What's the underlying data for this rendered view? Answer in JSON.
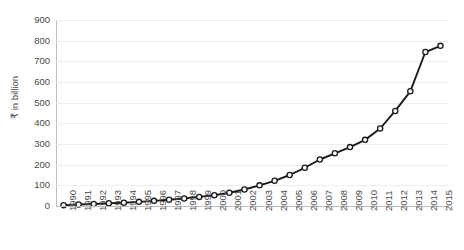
{
  "chart_data": {
    "type": "line",
    "title": "",
    "subtitle": "",
    "xlabel": "",
    "ylabel": "₹ in billion",
    "categories": [
      "1990",
      "1991",
      "1992",
      "1993",
      "1994",
      "1995",
      "1996",
      "1997",
      "1998",
      "1999",
      "2000",
      "2001",
      "2002",
      "2003",
      "2004",
      "2005",
      "2006",
      "2007",
      "2008",
      "2009",
      "2010",
      "2011",
      "2012",
      "2013",
      "2014",
      "2015"
    ],
    "values": [
      4,
      7,
      10,
      13,
      16,
      20,
      25,
      30,
      36,
      44,
      52,
      64,
      80,
      100,
      122,
      150,
      185,
      225,
      255,
      285,
      320,
      375,
      460,
      555,
      745,
      775
    ],
    "series": [
      {
        "name": "Value",
        "values": [
          4,
          7,
          10,
          13,
          16,
          20,
          25,
          30,
          36,
          44,
          52,
          64,
          80,
          100,
          122,
          150,
          185,
          225,
          255,
          285,
          320,
          375,
          460,
          555,
          745,
          775
        ]
      }
    ],
    "ylim": [
      0,
      900
    ],
    "yticks": [
      0,
      100,
      200,
      300,
      400,
      500,
      600,
      700,
      800,
      900
    ],
    "ytick_labels": [
      "0",
      "100",
      "200",
      "300",
      "400",
      "500",
      "600",
      "700",
      "800",
      "900"
    ],
    "grid": true,
    "grid_axis": "y",
    "legend": false,
    "legend_position": "none",
    "marker": "open-circle",
    "line_color": "#1a1a1a",
    "marker_fill": "#f7f7f7",
    "grid_color": "#ededed",
    "background": "#ffffff"
  }
}
